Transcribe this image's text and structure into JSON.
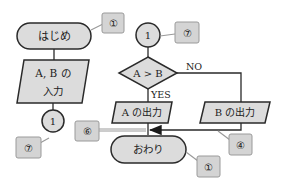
{
  "colors": {
    "shape_fill": "#dcdcdc",
    "stroke": "#2a2a2a",
    "callout_fill": "#d4d4d4",
    "callout_stroke": "#9a9a9a",
    "background": "#ffffff"
  },
  "flowchart_left": {
    "start": {
      "label": "はじめ"
    },
    "input": {
      "line1": "A, B の",
      "line2": "入力"
    },
    "connector": {
      "label": "1"
    }
  },
  "flowchart_right": {
    "connector": {
      "label": "1"
    },
    "decision": {
      "label": "A > B",
      "no_label": "NO",
      "yes_label": "YES"
    },
    "output_a": {
      "label": "A の出力"
    },
    "output_b": {
      "label": "B の出力"
    },
    "end": {
      "label": "おわり"
    }
  },
  "callouts": [
    {
      "id": "start",
      "label": "①"
    },
    {
      "id": "left-connector",
      "label": "⑦"
    },
    {
      "id": "right-connector",
      "label": "⑦"
    },
    {
      "id": "merge-arrow",
      "label": "⑥"
    },
    {
      "id": "b-line",
      "label": "④"
    },
    {
      "id": "end",
      "label": "①"
    }
  ]
}
